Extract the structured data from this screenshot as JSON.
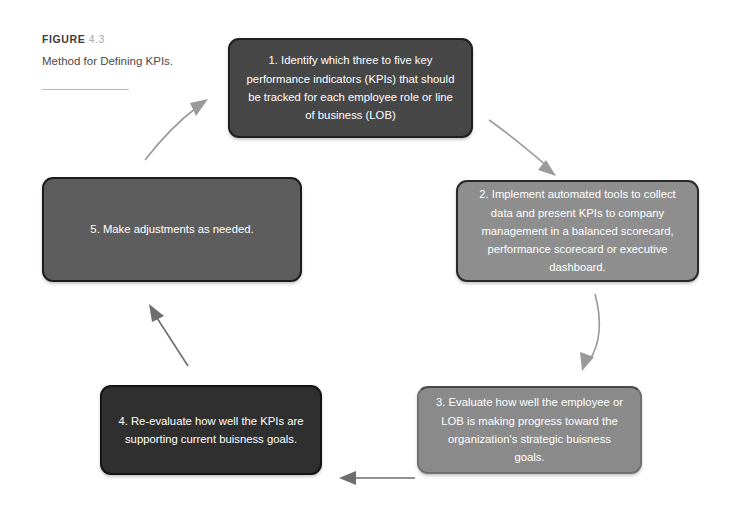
{
  "figure": {
    "label_word": "FIGURE",
    "number": "4.3",
    "title": "Method for Defining KPIs."
  },
  "diagram": {
    "type": "cycle-flowchart",
    "steps": [
      {
        "id": "step-1",
        "number": "1",
        "text": "1. Identify which three to five key performance indicators (KPIs) that should be tracked for each employee role or line of business (LOB)",
        "color": "#474747"
      },
      {
        "id": "step-2",
        "number": "2",
        "text": "2. Implement automated tools to collect data and present KPIs to company management in a balanced scorecard, performance scorecard or executive dashboard.",
        "color": "#8e8e8e"
      },
      {
        "id": "step-3",
        "number": "3",
        "text": "3. Evaluate how well the employee or LOB is making progress toward the organization's strategic buisness goals.",
        "color": "#8a8a8a"
      },
      {
        "id": "step-4",
        "number": "4",
        "text": "4. Re-evaluate how well the KPIs are supporting current buisness goals.",
        "color": "#2f2f2f"
      },
      {
        "id": "step-5",
        "number": "5",
        "text": "5. Make adjustments as needed.",
        "color": "#5d5d5d"
      }
    ],
    "connectors": [
      {
        "id": "arrow-1-to-2",
        "from": "step-1",
        "to": "step-2",
        "direction": "down-right"
      },
      {
        "id": "arrow-2-to-3",
        "from": "step-2",
        "to": "step-3",
        "direction": "down"
      },
      {
        "id": "arrow-3-to-4",
        "from": "step-3",
        "to": "step-4",
        "direction": "left"
      },
      {
        "id": "arrow-4-to-5",
        "from": "step-4",
        "to": "step-5",
        "direction": "up-left"
      },
      {
        "id": "arrow-5-to-1",
        "from": "step-5",
        "to": "step-1",
        "direction": "up-right"
      }
    ],
    "colors": {
      "background": "#ffffff",
      "arrow": "#9a9a9a",
      "arrow_dark": "#6e6e6e",
      "box_text": "#ffffff",
      "caption_title": "#4a4a4a",
      "caption_number": "#a8a8a8",
      "rule": "#b9b9b9"
    }
  }
}
